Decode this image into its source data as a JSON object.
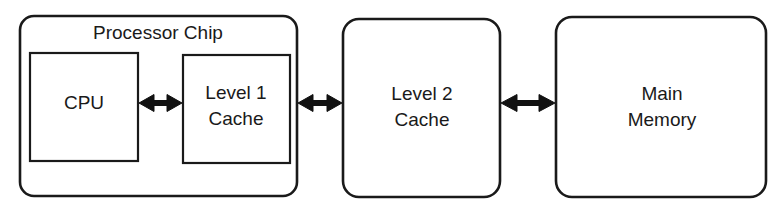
{
  "diagram": {
    "type": "block-diagram",
    "canvas": {
      "width": 783,
      "height": 215
    },
    "style": {
      "background_color": "#ffffff",
      "stroke_color": "#1a1a1a",
      "fill_color": "#ffffff",
      "text_color": "#1a1a1a",
      "font_size_px": 19
    },
    "nodes": [
      {
        "id": "processor-chip",
        "label": "Processor Chip",
        "shape": "rounded-rect",
        "label_position": "top-center",
        "x": 20,
        "y": 16,
        "width": 277,
        "height": 180,
        "radius": 14
      },
      {
        "id": "cpu",
        "label": "CPU",
        "label_line_1": "CPU",
        "label_line_2": "",
        "shape": "rect",
        "x": 30,
        "y": 53,
        "width": 108,
        "height": 108,
        "radius": 0
      },
      {
        "id": "level-1-cache",
        "label": "Level 1 Cache",
        "label_line_1": "Level 1",
        "label_line_2": "Cache",
        "shape": "rect",
        "x": 183,
        "y": 55,
        "width": 107,
        "height": 108,
        "radius": 0
      },
      {
        "id": "level-2-cache",
        "label": "Level 2 Cache",
        "label_line_1": "Level 2",
        "label_line_2": "Cache",
        "shape": "rounded-rect",
        "x": 343,
        "y": 19,
        "width": 157,
        "height": 178,
        "radius": 16
      },
      {
        "id": "main-memory",
        "label": "Main Memory",
        "label_line_1": "Main",
        "label_line_2": "Memory",
        "shape": "rounded-rect",
        "x": 556,
        "y": 17,
        "width": 210,
        "height": 180,
        "radius": 16
      }
    ],
    "connectors": [
      {
        "id": "cpu-to-l1",
        "from": "cpu",
        "to": "level-1-cache",
        "kind": "double-headed-arrow",
        "orientation": "horizontal",
        "x1": 139,
        "x2": 182,
        "y": 103
      },
      {
        "id": "l1-to-l2",
        "from": "processor-chip",
        "to": "level-2-cache",
        "kind": "double-headed-arrow",
        "orientation": "horizontal",
        "x1": 298,
        "x2": 342,
        "y": 103
      },
      {
        "id": "l2-to-memory",
        "from": "level-2-cache",
        "to": "main-memory",
        "kind": "double-headed-arrow",
        "orientation": "horizontal",
        "x1": 501,
        "x2": 555,
        "y": 103
      }
    ]
  }
}
